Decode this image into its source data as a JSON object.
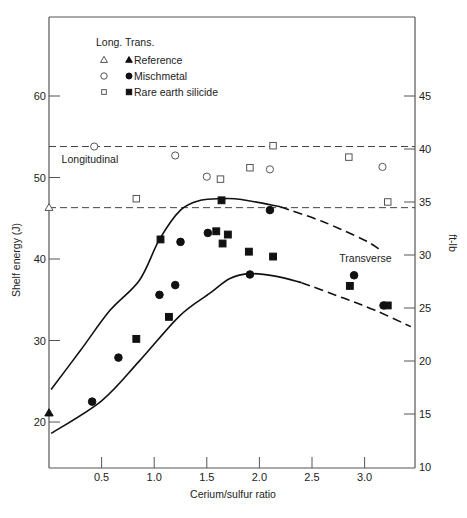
{
  "chart_data": {
    "type": "scatter",
    "title": "",
    "xlabel": "Cerium/sulfur ratio",
    "ylabel": "Shelf energy (J)",
    "y2label": "ft-lb",
    "xlim": [
      0,
      3.45
    ],
    "ylim": [
      14.5,
      68.5
    ],
    "y2lim": [
      10,
      50
    ],
    "grid": false,
    "x_ticks": [
      0.5,
      1.0,
      1.5,
      2.0,
      2.5,
      3.0
    ],
    "x_tick_labels": [
      "0.5",
      "1.0",
      "1.5",
      "2.0",
      "2.5",
      "3.0"
    ],
    "y_ticks": [
      20,
      30,
      40,
      50,
      60
    ],
    "y_tick_labels": [
      "20",
      "30",
      "40",
      "50",
      "60"
    ],
    "y2_ticks": [
      10,
      15,
      20,
      25,
      30,
      35,
      40,
      45
    ],
    "y2_tick_labels": [
      "10",
      "15",
      "20",
      "25",
      "30",
      "35",
      "40",
      "45"
    ],
    "legend": {
      "position": "upper left",
      "header": "Long. Trans.",
      "entries": [
        {
          "label": "Reference",
          "long_marker": "open-triangle",
          "trans_marker": "filled-triangle"
        },
        {
          "label": "Mischmetal",
          "long_marker": "open-circle",
          "trans_marker": "filled-circle"
        },
        {
          "label": "Rare earth silicide",
          "long_marker": "open-square",
          "trans_marker": "filled-square"
        }
      ]
    },
    "annotations": [
      {
        "text": "Longitudinal",
        "x": 0.12,
        "y": 51.8
      },
      {
        "text": "Transverse",
        "x": 2.76,
        "y": 39.6
      }
    ],
    "reference_lines": [
      {
        "y": 53.8,
        "style": "dashed",
        "label": "Longitudinal band upper"
      },
      {
        "y": 46.3,
        "style": "dashed",
        "label": "Longitudinal reference"
      }
    ],
    "series": [
      {
        "name": "Reference (Longitudinal)",
        "marker": "open-triangle",
        "points": [
          [
            0.0,
            46.3
          ]
        ]
      },
      {
        "name": "Reference (Transverse)",
        "marker": "filled-triangle",
        "points": [
          [
            0.0,
            21.1
          ]
        ]
      },
      {
        "name": "Mischmetal (Longitudinal)",
        "marker": "open-circle",
        "points": [
          [
            0.43,
            53.8
          ],
          [
            1.2,
            52.7
          ],
          [
            1.5,
            50.1
          ],
          [
            2.1,
            51.0
          ],
          [
            3.17,
            51.3
          ]
        ]
      },
      {
        "name": "Mischmetal (Transverse)",
        "marker": "filled-circle",
        "points": [
          [
            0.41,
            22.5
          ],
          [
            0.66,
            27.9
          ],
          [
            1.05,
            35.6
          ],
          [
            1.2,
            36.8
          ],
          [
            1.25,
            42.1
          ],
          [
            1.51,
            43.2
          ],
          [
            1.91,
            38.1
          ],
          [
            2.1,
            46.0
          ],
          [
            2.9,
            38.0
          ],
          [
            3.18,
            34.3
          ]
        ]
      },
      {
        "name": "Rare earth silicide (Longitudinal)",
        "marker": "open-square",
        "points": [
          [
            0.83,
            47.4
          ],
          [
            1.63,
            49.8
          ],
          [
            1.91,
            51.2
          ],
          [
            2.13,
            53.9
          ],
          [
            2.85,
            52.5
          ],
          [
            3.22,
            47.0
          ]
        ]
      },
      {
        "name": "Rare earth silicide (Transverse)",
        "marker": "filled-square",
        "points": [
          [
            0.83,
            30.2
          ],
          [
            1.06,
            42.4
          ],
          [
            1.14,
            32.9
          ],
          [
            1.59,
            43.4
          ],
          [
            1.64,
            47.2
          ],
          [
            1.65,
            41.9
          ],
          [
            1.7,
            43.0
          ],
          [
            1.9,
            40.9
          ],
          [
            2.13,
            40.3
          ],
          [
            2.86,
            36.7
          ],
          [
            3.22,
            34.3
          ]
        ]
      }
    ],
    "curves": [
      {
        "name": "Transverse upper bound",
        "solid_points": [
          [
            0.02,
            24.0
          ],
          [
            0.3,
            28.8
          ],
          [
            0.58,
            33.7
          ],
          [
            0.86,
            37.4
          ],
          [
            1.05,
            42.4
          ],
          [
            1.25,
            46.0
          ],
          [
            1.44,
            47.2
          ],
          [
            1.64,
            47.4
          ],
          [
            1.83,
            47.3
          ],
          [
            2.2,
            46.4
          ]
        ],
        "dashed_points": [
          [
            2.2,
            46.4
          ],
          [
            2.6,
            44.6
          ],
          [
            3.0,
            42.3
          ],
          [
            3.15,
            41.1
          ]
        ]
      },
      {
        "name": "Transverse lower bound",
        "solid_points": [
          [
            0.02,
            18.6
          ],
          [
            0.5,
            22.6
          ],
          [
            0.86,
            27.5
          ],
          [
            1.24,
            33.0
          ],
          [
            1.53,
            35.8
          ],
          [
            1.72,
            37.6
          ],
          [
            1.91,
            38.2
          ],
          [
            2.15,
            37.9
          ],
          [
            2.4,
            37.1
          ]
        ],
        "dashed_points": [
          [
            2.4,
            37.1
          ],
          [
            2.8,
            35.2
          ],
          [
            3.1,
            33.7
          ],
          [
            3.44,
            31.7
          ]
        ]
      }
    ]
  }
}
